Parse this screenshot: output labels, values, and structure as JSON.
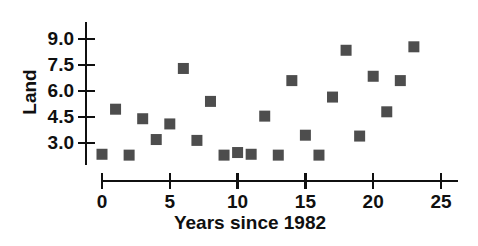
{
  "chart_data": {
    "type": "scatter",
    "title": "",
    "xlabel": "Years since 1982",
    "ylabel": "Land",
    "xlim": [
      -1.2,
      26.5
    ],
    "ylim": [
      1.9,
      9.9
    ],
    "xticks": [
      0,
      5,
      10,
      15,
      20,
      25
    ],
    "xtick_labels": [
      "0",
      "5",
      "10",
      "15",
      "20",
      "25"
    ],
    "yticks": [
      3.0,
      4.5,
      6.0,
      7.5,
      9.0
    ],
    "ytick_labels": [
      "3.0",
      "4.5",
      "6.0",
      "7.5",
      "9.0"
    ],
    "grid": false,
    "legend": null,
    "marker": {
      "shape": "square",
      "color": "#4d4d4d",
      "size_px": 11
    },
    "points": [
      {
        "x": 0,
        "y": 2.35
      },
      {
        "x": 1,
        "y": 4.95
      },
      {
        "x": 2,
        "y": 2.3
      },
      {
        "x": 3,
        "y": 4.4
      },
      {
        "x": 4,
        "y": 3.2
      },
      {
        "x": 5,
        "y": 4.1
      },
      {
        "x": 6,
        "y": 7.3
      },
      {
        "x": 7,
        "y": 3.15
      },
      {
        "x": 8,
        "y": 5.4
      },
      {
        "x": 9,
        "y": 2.3
      },
      {
        "x": 10,
        "y": 2.45
      },
      {
        "x": 11,
        "y": 2.35
      },
      {
        "x": 12,
        "y": 4.55
      },
      {
        "x": 13,
        "y": 2.3
      },
      {
        "x": 14,
        "y": 6.6
      },
      {
        "x": 15,
        "y": 3.45
      },
      {
        "x": 16,
        "y": 2.3
      },
      {
        "x": 17,
        "y": 5.65
      },
      {
        "x": 18,
        "y": 8.35
      },
      {
        "x": 19,
        "y": 3.4
      },
      {
        "x": 20,
        "y": 6.85
      },
      {
        "x": 21,
        "y": 4.8
      },
      {
        "x": 22,
        "y": 6.6
      },
      {
        "x": 23,
        "y": 8.55
      }
    ]
  },
  "axes": {
    "axis_color": "#101010",
    "background": "#ffffff"
  }
}
